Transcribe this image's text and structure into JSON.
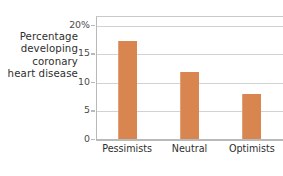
{
  "axis_caption": {
    "lines": [
      "Percentage",
      "developing",
      "coronary",
      "heart disease"
    ]
  },
  "colors": {
    "bar": "#d9854f",
    "gridline": "#d2d2d2",
    "axis": "#b9b9b9",
    "text": "#2e2e2e",
    "background": "#ffffff"
  },
  "chart_data": {
    "type": "bar",
    "title": "",
    "xlabel": "",
    "ylabel": "Percentage developing coronary heart disease",
    "categories": [
      "Pessimists",
      "Neutral",
      "Optimists"
    ],
    "values": [
      17.2,
      11.8,
      7.8
    ],
    "ylim": [
      0,
      21.5
    ],
    "yticks": [
      0,
      5,
      10,
      15,
      20
    ],
    "ytick_labels": [
      "0",
      "5",
      "10",
      "15",
      "20%"
    ],
    "grid": true,
    "legend": false,
    "series": [
      {
        "name": "Percentage developing coronary heart disease",
        "values": [
          17.2,
          11.8,
          7.8
        ],
        "color": "#d9854f"
      }
    ]
  }
}
